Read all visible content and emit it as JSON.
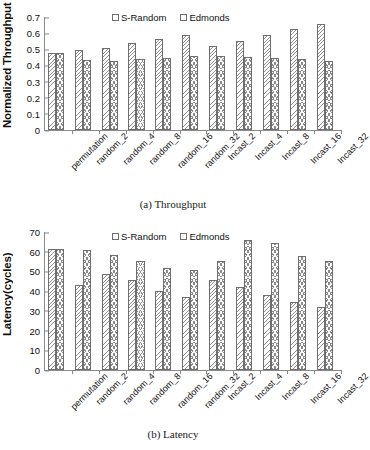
{
  "figure": {
    "panels": [
      {
        "id": "throughput",
        "caption": "(a) Throughput",
        "ylabel": "Normalized Throughput"
      },
      {
        "id": "latency",
        "caption": "(b) Latency",
        "ylabel": "Latency(cycles)"
      }
    ]
  },
  "legend": {
    "series_1": "S-Random",
    "series_2": "Edmonds"
  },
  "chart_data": [
    {
      "type": "bar",
      "id": "throughput",
      "title": "(a) Throughput",
      "xlabel": "",
      "ylabel": "Normalized Throughput",
      "ylim": [
        0,
        0.7
      ],
      "yticks": [
        "0",
        "0.1",
        "0.2",
        "0.3",
        "0.4",
        "0.5",
        "0.6",
        "0.7"
      ],
      "ytick_values": [
        0,
        0.1,
        0.2,
        0.3,
        0.4,
        0.5,
        0.6,
        0.7
      ],
      "grid": false,
      "legend_position": "top-center",
      "categories": [
        "permutation",
        "random_2",
        "random_4",
        "random_8",
        "random_16",
        "random_32",
        "Incast_2",
        "Incast_4",
        "Incast_8",
        "Incast_16",
        "Incast_32"
      ],
      "series": [
        {
          "name": "S-Random",
          "values": [
            0.476,
            0.494,
            0.511,
            0.538,
            0.561,
            0.591,
            0.522,
            0.551,
            0.588,
            0.627,
            0.659
          ]
        },
        {
          "name": "Edmonds",
          "values": [
            0.476,
            0.434,
            0.43,
            0.438,
            0.449,
            0.457,
            0.457,
            0.45,
            0.447,
            0.441,
            0.426
          ]
        }
      ]
    },
    {
      "type": "bar",
      "id": "latency",
      "title": "(b) Latency",
      "xlabel": "",
      "ylabel": "Latency(cycles)",
      "ylim": [
        0,
        70
      ],
      "yticks": [
        "0",
        "10",
        "20",
        "30",
        "40",
        "50",
        "60",
        "70"
      ],
      "ytick_values": [
        0,
        10,
        20,
        30,
        40,
        50,
        60,
        70
      ],
      "grid": false,
      "legend_position": "top-center",
      "categories": [
        "permutation",
        "random_2",
        "random_4",
        "random_8",
        "random_16",
        "random_32",
        "Incast_2",
        "Incast_4",
        "Incast_8",
        "Incast_16",
        "Incast_32"
      ],
      "series": [
        {
          "name": "S-Random",
          "values": [
            61.2,
            42.9,
            48.7,
            45.5,
            40.0,
            36.8,
            45.7,
            41.9,
            37.8,
            34.5,
            32.0
          ]
        },
        {
          "name": "Edmonds",
          "values": [
            61.2,
            60.9,
            58.3,
            55.4,
            51.6,
            50.8,
            55.3,
            66.0,
            64.6,
            57.8,
            55.2
          ]
        }
      ]
    }
  ],
  "colors": {
    "axis": "#8a8a8a",
    "bar_outline": "#6e6e6e",
    "hatch": "#8e8e8e",
    "text": "#111111",
    "background": "#ffffff"
  }
}
